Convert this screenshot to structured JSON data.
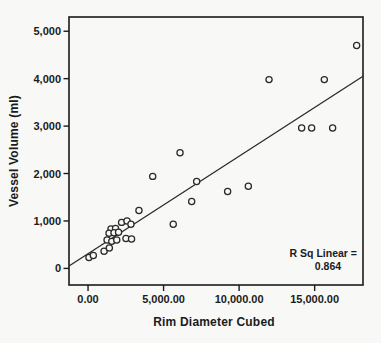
{
  "figure": {
    "background": "#f8f8f6",
    "ink_color": "#1b1b1b"
  },
  "chart_data": {
    "type": "scatter",
    "title": "",
    "xlabel": "Rim Diameter Cubed",
    "ylabel": "Vessel Volume (ml)",
    "xlim": [
      -1260,
      18200
    ],
    "ylim": [
      -350,
      5300
    ],
    "grid": false,
    "legend": null,
    "x_ticks": [
      {
        "v": 0,
        "label": "0.00"
      },
      {
        "v": 5000,
        "label": "5,000.00"
      },
      {
        "v": 10000,
        "label": "10,000.00"
      },
      {
        "v": 15000,
        "label": "15,000.00"
      }
    ],
    "y_ticks": [
      {
        "v": 0,
        "label": "0"
      },
      {
        "v": 1000,
        "label": "1,000"
      },
      {
        "v": 2000,
        "label": "2,000"
      },
      {
        "v": 3000,
        "label": "3,000"
      },
      {
        "v": 4000,
        "label": "4,000"
      },
      {
        "v": 5000,
        "label": "5,000"
      }
    ],
    "points": [
      [
        17780,
        4700
      ],
      [
        11980,
        3980
      ],
      [
        15640,
        3980
      ],
      [
        14140,
        2960
      ],
      [
        14800,
        2960
      ],
      [
        16190,
        2960
      ],
      [
        6090,
        2440
      ],
      [
        4280,
        1940
      ],
      [
        7190,
        1830
      ],
      [
        10610,
        1730
      ],
      [
        9240,
        1620
      ],
      [
        6860,
        1410
      ],
      [
        5640,
        930
      ],
      [
        3370,
        1220
      ],
      [
        2220,
        970
      ],
      [
        2580,
        1000
      ],
      [
        2840,
        930
      ],
      [
        1520,
        830
      ],
      [
        1820,
        840
      ],
      [
        1390,
        740
      ],
      [
        1720,
        750
      ],
      [
        2020,
        760
      ],
      [
        1260,
        600
      ],
      [
        1570,
        570
      ],
      [
        1900,
        600
      ],
      [
        2510,
        630
      ],
      [
        2880,
        620
      ],
      [
        1060,
        360
      ],
      [
        1410,
        430
      ],
      [
        60,
        230
      ],
      [
        350,
        270
      ]
    ],
    "trend_line": {
      "x1": -1260,
      "y1": 50,
      "x2": 18200,
      "y2": 4050
    },
    "annotation": {
      "line1": "R Sq Linear =",
      "line2": "0.864"
    }
  }
}
